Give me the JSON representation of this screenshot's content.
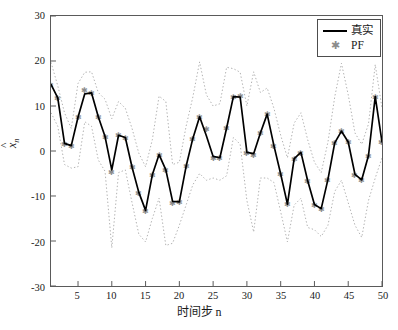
{
  "chart_data": {
    "type": "line",
    "title": "",
    "xlabel": "时间步 n",
    "ylabel": "x̂n",
    "xlim": [
      1,
      50
    ],
    "ylim": [
      -30,
      30
    ],
    "xticks": [
      5,
      10,
      15,
      20,
      25,
      30,
      35,
      40,
      45,
      50
    ],
    "yticks": [
      30,
      20,
      10,
      0,
      -10,
      -20,
      -30
    ],
    "grid": false,
    "legend_position": "top-right",
    "x": [
      1,
      2,
      3,
      4,
      5,
      6,
      7,
      8,
      9,
      10,
      11,
      12,
      13,
      14,
      15,
      16,
      17,
      18,
      19,
      20,
      21,
      22,
      23,
      24,
      25,
      26,
      27,
      28,
      29,
      30,
      31,
      32,
      33,
      34,
      35,
      36,
      37,
      38,
      39,
      40,
      41,
      42,
      43,
      44,
      45,
      46,
      47,
      48,
      49,
      50
    ],
    "series": [
      {
        "name": "真实",
        "style": "solid",
        "color": "#000000",
        "values": [
          14.8,
          11.8,
          1.7,
          1.2,
          7.5,
          12.7,
          12.9,
          7.6,
          3.2,
          -4.2,
          3.5,
          3.0,
          -3.6,
          -9.2,
          -13.2,
          -5.3,
          -0.8,
          -4.2,
          -11.2,
          -11.3,
          -3.4,
          2.8,
          7.6,
          3.4,
          -1.2,
          -1.5,
          5.1,
          12.1,
          12.0,
          -0.3,
          -0.6,
          4.0,
          8.2,
          1.2,
          -5.1,
          -11.8,
          -1.7,
          -0.3,
          -6.6,
          -11.9,
          -12.8,
          -6.3,
          1.8,
          4.4,
          2.0,
          -5.2,
          -6.4,
          -1.0,
          12.1,
          2.0
        ]
      },
      {
        "name": "PF",
        "style": "marker-star",
        "color": "#8c8c8c",
        "values": [
          14.8,
          11.8,
          1.7,
          1.2,
          7.5,
          13.5,
          13.0,
          7.6,
          3.2,
          -4.6,
          3.5,
          3.0,
          -3.6,
          -9.2,
          -13.2,
          -5.3,
          -0.8,
          -4.1,
          -11.6,
          -11.3,
          -3.4,
          2.8,
          7.6,
          5.0,
          -1.5,
          -1.5,
          5.1,
          12.1,
          12.3,
          -0.3,
          -0.8,
          4.0,
          8.2,
          1.2,
          -5.1,
          -11.8,
          -1.7,
          -0.3,
          -6.6,
          -11.9,
          -12.8,
          -6.3,
          1.8,
          4.4,
          2.0,
          -5.2,
          -6.4,
          -1.0,
          12.1,
          2.0
        ]
      },
      {
        "name": "upper-band",
        "style": "dotted",
        "color": "#b0b0b0",
        "values": [
          19.7,
          14.5,
          8.5,
          5.0,
          15.0,
          17.5,
          17.6,
          13.0,
          11.5,
          7.2,
          11.0,
          9.5,
          5.0,
          -0.5,
          -3.5,
          2.5,
          12.2,
          11.0,
          -3.0,
          -2.5,
          5.5,
          12.0,
          19.8,
          12.5,
          10.0,
          10.5,
          18.6,
          18.3,
          17.5,
          10.0,
          17.6,
          13.0,
          14.0,
          9.5,
          3.5,
          -1.5,
          6.2,
          8.5,
          2.5,
          -2.5,
          -4.8,
          2.0,
          12.0,
          19.5,
          12.5,
          4.0,
          1.5,
          6.0,
          19.2,
          9.5
        ]
      },
      {
        "name": "lower-band",
        "style": "dotted",
        "color": "#b0b0b0",
        "values": [
          8.5,
          5.5,
          -3.0,
          -3.8,
          -3.5,
          6.5,
          5.5,
          -2.0,
          -4.5,
          -21.5,
          -4.8,
          -4.2,
          -11.5,
          -18.5,
          -20.2,
          -15.0,
          -10.5,
          -21.0,
          -20.5,
          -16.5,
          -12.0,
          -7.5,
          -5.0,
          -6.5,
          -6.0,
          -6.5,
          -5.5,
          3.0,
          1.5,
          -11.0,
          -18.0,
          -6.0,
          -6.0,
          -7.0,
          -13.5,
          -20.2,
          -12.0,
          -10.5,
          -17.0,
          -17.5,
          -19.0,
          -16.5,
          -9.0,
          -6.5,
          -11.5,
          -16.5,
          -19.2,
          -11.0,
          -6.0,
          -1.5
        ]
      }
    ],
    "legend_entries": [
      {
        "label": "真实",
        "marker": "line"
      },
      {
        "label": "PF",
        "marker": "star"
      }
    ]
  },
  "axis": {
    "y_title_base": "x",
    "y_title_hat": "^",
    "y_title_sub": "n",
    "x_title": "时间步 n"
  },
  "colors": {
    "true_line": "#000000",
    "pf_marker": "#8c8c8c",
    "band": "#b0b0b0",
    "axis": "#5a5a5a",
    "background": "#ffffff"
  }
}
